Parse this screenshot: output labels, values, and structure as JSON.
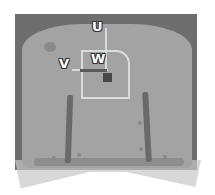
{
  "diagram": {
    "labels": {
      "u": "U",
      "v": "V",
      "w": "W"
    },
    "colors": {
      "background": "#ffffff",
      "frame": "#6e6e6e",
      "field": "#a3a3a3",
      "outline": "#dcdcdc",
      "marker": "#474747",
      "bars": "#6a6a6a"
    }
  }
}
